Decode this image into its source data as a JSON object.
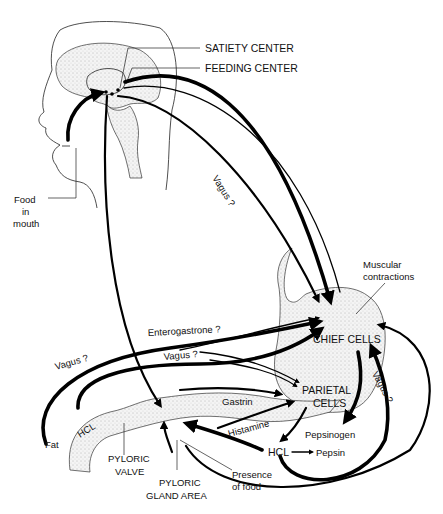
{
  "diagram": {
    "type": "physiological-flow-diagram",
    "head_labels": {
      "satiety_center": "SATIETY CENTER",
      "feeding_center": "FEEDING CENTER",
      "food_in_mouth_line1": "Food",
      "food_in_mouth_line2": "in",
      "food_in_mouth_line3": "mouth"
    },
    "pathway_labels": {
      "vagus_outer": "Vagus ?",
      "vagus_inner": "Vagus ?",
      "enterogastrone": "Enterogastrone ?",
      "vagus_fat": "Vagus ?",
      "vagus_mid": "Vagus ?",
      "gastrin": "Gastrin",
      "histamine": "Histamine"
    },
    "stomach_labels": {
      "muscular_line1": "Muscular",
      "muscular_line2": "contractions",
      "chief_cells": "CHIEF CELLS",
      "parietal_line1": "PARIETAL",
      "parietal_line2": "CELLS",
      "pepsinogen": "Pepsinogen",
      "pepsin": "Pepsin",
      "hcl_stomach": "HCL"
    },
    "duodenum_labels": {
      "fat": "Fat",
      "hcl_duodenum": "HCL",
      "pyloric_valve_line1": "PYLORIC",
      "pyloric_valve_line2": "VALVE",
      "pyloric_gland_line1": "PYLORIC",
      "pyloric_gland_line2": "GLAND AREA",
      "presence_line1": "Presence",
      "presence_line2": "of food"
    },
    "colors": {
      "ink": "#000000",
      "background": "#ffffff"
    }
  }
}
